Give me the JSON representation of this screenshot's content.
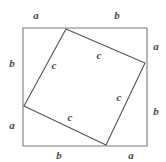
{
  "figure": {
    "canvas": {
      "width": 166,
      "height": 162
    },
    "colors": {
      "background": "#ffffff",
      "outer_square_stroke": "#7a7a7a",
      "inner_square_stroke": "#555555",
      "label_text": "#4a4a4a"
    },
    "stroke_widths": {
      "outer_square": 1.1,
      "inner_square": 1.1
    },
    "outer_square": {
      "name": "outer-square",
      "points": "23,28 147,28 147,146 23,146",
      "corners": {
        "top_left": [
          23,
          28
        ],
        "top_right": [
          147,
          28
        ],
        "bottom_right": [
          147,
          146
        ],
        "bottom_left": [
          23,
          146
        ]
      }
    },
    "inner_square": {
      "name": "inner-square",
      "points": "66,29 145,63 106,145 24,106",
      "vertices": {
        "top": [
          66,
          29
        ],
        "right": [
          145,
          63
        ],
        "bottom": [
          106,
          145
        ],
        "left": [
          24,
          106
        ]
      }
    },
    "labels": [
      {
        "id": "top-left-a",
        "text": "a",
        "x": 36,
        "y": 15,
        "kind": "side",
        "edge": "top",
        "segment": "left"
      },
      {
        "id": "top-right-b",
        "text": "b",
        "x": 117,
        "y": 15,
        "kind": "side",
        "edge": "top",
        "segment": "right"
      },
      {
        "id": "right-top-a",
        "text": "a",
        "x": 156,
        "y": 46,
        "kind": "side",
        "edge": "right",
        "segment": "top"
      },
      {
        "id": "right-bottom-b",
        "text": "b",
        "x": 156,
        "y": 111,
        "kind": "side",
        "edge": "right",
        "segment": "bottom"
      },
      {
        "id": "bottom-left-b",
        "text": "b",
        "x": 59,
        "y": 155,
        "kind": "side",
        "edge": "bottom",
        "segment": "left"
      },
      {
        "id": "bottom-right-a",
        "text": "a",
        "x": 131,
        "y": 155,
        "kind": "side",
        "edge": "bottom",
        "segment": "right"
      },
      {
        "id": "left-top-b",
        "text": "b",
        "x": 12,
        "y": 63,
        "kind": "side",
        "edge": "left",
        "segment": "top"
      },
      {
        "id": "left-bottom-a",
        "text": "a",
        "x": 12,
        "y": 125,
        "kind": "side",
        "edge": "left",
        "segment": "bottom"
      },
      {
        "id": "hyp-upper-left",
        "text": "c",
        "x": 54,
        "y": 65,
        "kind": "hypotenuse",
        "side": "upper-left"
      },
      {
        "id": "hyp-upper-right",
        "text": "c",
        "x": 99,
        "y": 55,
        "kind": "hypotenuse",
        "side": "upper-right"
      },
      {
        "id": "hyp-lower-right",
        "text": "c",
        "x": 119,
        "y": 97,
        "kind": "hypotenuse",
        "side": "lower-right"
      },
      {
        "id": "hyp-lower-left",
        "text": "c",
        "x": 70,
        "y": 117,
        "kind": "hypotenuse",
        "side": "lower-left"
      }
    ]
  }
}
